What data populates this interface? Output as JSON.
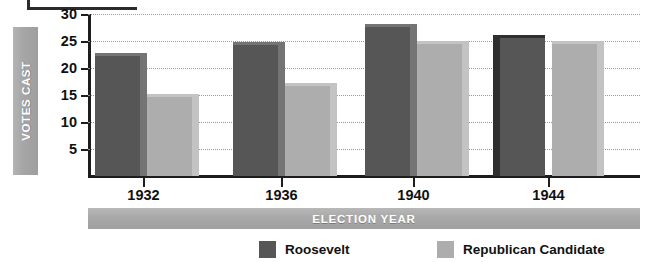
{
  "chart_data": {
    "type": "bar",
    "title": "",
    "xlabel": "ELECTION YEAR",
    "ylabel": "VOTES CAST",
    "categories": [
      "1932",
      "1936",
      "1940",
      "1944"
    ],
    "series": [
      {
        "name": "Roosevelt",
        "color": "#565656",
        "values": [
          22.8,
          24.8,
          28.2,
          26.2
        ]
      },
      {
        "name": "Republican Candidate",
        "color": "#adadad",
        "values": [
          15.1,
          17.3,
          25.0,
          25.0
        ]
      }
    ],
    "yticks": [
      5,
      10,
      15,
      20,
      25,
      30
    ],
    "ytick_labels": [
      "5",
      "10",
      "15",
      "20",
      "25",
      "30"
    ],
    "ylim": [
      0,
      30
    ],
    "grid": true,
    "grid_style": "dotted-horizontal",
    "legend_position": "bottom-center",
    "bar_style": "3d-extruded"
  },
  "axes": {
    "y_title": "VOTES CAST",
    "x_title": "ELECTION YEAR"
  },
  "legend": {
    "items": [
      {
        "label": "Roosevelt",
        "color": "#565656"
      },
      {
        "label": "Republican Candidate",
        "color": "#adadad"
      }
    ]
  },
  "colors": {
    "roosevelt": "#565656",
    "roosevelt_side": "#747474",
    "roosevelt_side_dark": "#2f2f2f",
    "republican": "#adadad",
    "republican_side": "#c3c3c3",
    "band_gray": "#a8a8a8",
    "axis": "#1d1d1d",
    "grid": "#9a9a9a",
    "text": "#111111",
    "band_text": "#ffffff"
  }
}
